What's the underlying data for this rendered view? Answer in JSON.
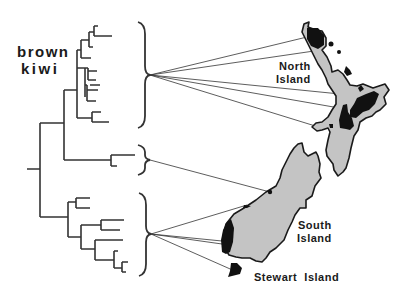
{
  "figure": {
    "taxon_label_line1": "brown",
    "taxon_label_line2": "kiwi",
    "regions": [
      {
        "id": "north",
        "label_line1": "North",
        "label_line2": "Island"
      },
      {
        "id": "south",
        "label_line1": "South",
        "label_line2": "Island"
      },
      {
        "id": "stewart",
        "label_line1": "Stewart  Island",
        "label_line2": ""
      }
    ],
    "clades": [
      {
        "id": "north-island-clade",
        "region": "North Island",
        "tips": 9,
        "links": 5
      },
      {
        "id": "central-clade",
        "region": "South Island (north)",
        "tips": 2,
        "links": 1
      },
      {
        "id": "south-clade",
        "region": "South Island / Stewart Island",
        "tips": 8,
        "links": 4
      }
    ],
    "colors": {
      "land": "#c4c4c4",
      "range": "#111111",
      "lines": "#333333"
    }
  }
}
